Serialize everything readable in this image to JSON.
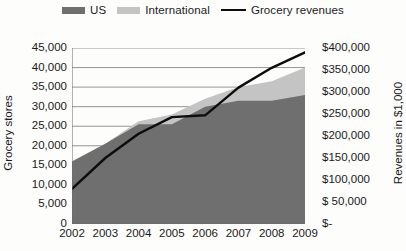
{
  "legend": {
    "entries": [
      {
        "label": "US",
        "marker": "area-swatch",
        "color": "#6f6f6f"
      },
      {
        "label": "International",
        "marker": "area-swatch",
        "color": "#c4c4c4"
      },
      {
        "label": "Grocery revenues",
        "marker": "line-swatch",
        "color": "#0d0d0d"
      }
    ]
  },
  "chart_data": {
    "type": "area",
    "title": "",
    "xlabel": "",
    "ylabel": "Grocery stores",
    "y2label": "Revenues in $1,000",
    "categories": [
      "2002",
      "2003",
      "2004",
      "2005",
      "2006",
      "2007",
      "2008",
      "2009"
    ],
    "ylim": [
      0,
      45000
    ],
    "yticks": [
      0,
      5000,
      10000,
      15000,
      20000,
      25000,
      30000,
      35000,
      40000,
      45000
    ],
    "yticklabels": [
      "0",
      "5,000",
      "10,000",
      "15,000",
      "20,000",
      "25,000",
      "30,000",
      "35,000",
      "40,000",
      "45,000"
    ],
    "y2lim": [
      0,
      400000
    ],
    "y2ticks": [
      0,
      50000,
      100000,
      150000,
      200000,
      250000,
      300000,
      350000,
      400000
    ],
    "y2ticklabels": [
      "$-",
      "$  50,000",
      "$100,000",
      "$150,000",
      "$200,000",
      "$250,000",
      "$300,000",
      "$350,000",
      "$400,000"
    ],
    "grid": true,
    "legend_position": "top-center",
    "stacked": true,
    "series": [
      {
        "name": "US",
        "axis": "left",
        "type": "area",
        "color": "#6f6f6f",
        "values": [
          16000,
          20500,
          25500,
          25500,
          30000,
          31500,
          31500,
          33000
        ]
      },
      {
        "name": "International",
        "axis": "left",
        "type": "area",
        "color": "#c4c4c4",
        "values": [
          0,
          0,
          800,
          2500,
          2000,
          3500,
          5000,
          7000
        ]
      },
      {
        "name": "Grocery revenues",
        "axis": "right",
        "type": "line",
        "color": "#0d0d0d",
        "values": [
          80000,
          150000,
          205000,
          243000,
          247000,
          310000,
          355000,
          390000
        ]
      }
    ]
  }
}
